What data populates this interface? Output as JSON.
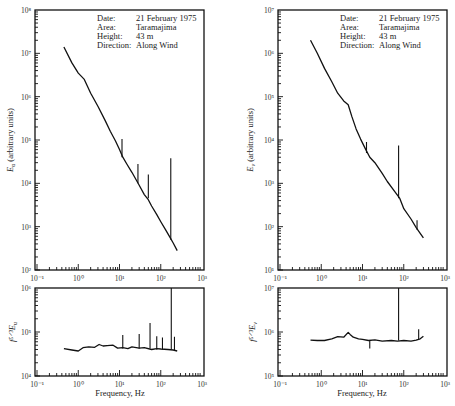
{
  "chart_data": [
    {
      "id": "left-top",
      "type": "line",
      "title": "",
      "xlabel": "",
      "ylabel": "E_u (arbitrary units)",
      "xscale": "log",
      "yscale": "log",
      "xlim": [
        0.1,
        1000
      ],
      "ylim": [
        100,
        100000000
      ],
      "x_tick_labels": [
        "10⁻¹",
        "10⁰",
        "10¹",
        "10²",
        "10³"
      ],
      "y_tick_labels": [
        "10⁸",
        "10⁷",
        "10⁶",
        "10⁵",
        "10⁴",
        "10³",
        "10²"
      ],
      "annotation": [
        {
          "key": "Date:",
          "value": "21 February 1975"
        },
        {
          "key": "Area:",
          "value": "Taramajima"
        },
        {
          "key": "Height:",
          "value": "43 m"
        },
        {
          "key": "Direction:",
          "value": "Along Wind"
        }
      ],
      "series": [
        {
          "name": "E_u",
          "x": [
            0.45,
            0.7,
            1.0,
            1.4,
            2.0,
            3.0,
            4.5,
            6.0,
            8.0,
            10,
            12,
            15,
            20,
            30,
            40,
            50,
            60,
            80,
            100,
            130,
            170,
            200,
            250
          ],
          "y": [
            14000000,
            6000000,
            3500000,
            2500000,
            1200000,
            600000,
            280000,
            160000,
            95000,
            60000,
            40000,
            28000,
            18000,
            9000,
            5500,
            4200,
            3000,
            1900,
            1300,
            850,
            550,
            420,
            280
          ],
          "spikes": [
            {
              "x": 11.5,
              "y_base": 40000,
              "y_peak": 105000
            },
            {
              "x": 28,
              "y_base": 10000,
              "y_peak": 28000
            },
            {
              "x": 50,
              "y_base": 4500,
              "y_peak": 16000
            },
            {
              "x": 175,
              "y_base": 500,
              "y_peak": 38000
            }
          ]
        }
      ]
    },
    {
      "id": "left-bottom",
      "type": "line",
      "xlabel": "Frequency, Hz",
      "ylabel": "f^{5/3}E_u",
      "xscale": "log",
      "yscale": "log",
      "xlim": [
        0.1,
        1000
      ],
      "ylim": [
        10000,
        1000000
      ],
      "x_tick_labels": [
        "10⁻¹",
        "10⁰",
        "10¹",
        "10²",
        "10³"
      ],
      "y_tick_labels": [
        "10⁶",
        "10⁵",
        "10⁴"
      ],
      "series": [
        {
          "name": "f^{5/3}E_u",
          "x": [
            0.45,
            0.7,
            1.0,
            1.3,
            1.8,
            2.5,
            3.2,
            4.0,
            5.0,
            7.0,
            9.0,
            12,
            16,
            20,
            30,
            40,
            60,
            80,
            100,
            150,
            200,
            250
          ],
          "y": [
            42000,
            39000,
            37000,
            44000,
            46000,
            45000,
            52000,
            48000,
            49000,
            50000,
            43000,
            44000,
            42000,
            46000,
            43000,
            44000,
            40000,
            42000,
            41000,
            40000,
            39000,
            37000
          ],
          "spikes": [
            {
              "x": 12,
              "y_base": 42000,
              "y_peak": 85000
            },
            {
              "x": 30,
              "y_base": 42000,
              "y_peak": 90000
            },
            {
              "x": 55,
              "y_base": 42000,
              "y_peak": 160000
            },
            {
              "x": 80,
              "y_base": 40000,
              "y_peak": 80000
            },
            {
              "x": 110,
              "y_base": 40000,
              "y_peak": 75000
            },
            {
              "x": 180,
              "y_base": 40000,
              "y_peak": 1000000
            },
            {
              "x": 215,
              "y_base": 38000,
              "y_peak": 78000
            }
          ]
        }
      ]
    },
    {
      "id": "right-top",
      "type": "line",
      "xlabel": "",
      "ylabel": "E_v (arbitrary units)",
      "xscale": "log",
      "yscale": "log",
      "xlim": [
        0.1,
        1000
      ],
      "ylim": [
        10,
        10000000
      ],
      "x_tick_labels": [
        "10⁻¹",
        "10⁰",
        "10¹",
        "10²",
        "10³"
      ],
      "y_tick_labels": [
        "10⁷",
        "10⁶",
        "10⁵",
        "10⁴",
        "10³",
        "10²",
        "10¹"
      ],
      "annotation": [
        {
          "key": "Date:",
          "value": "21 February 1975"
        },
        {
          "key": "Area:",
          "value": "Taramajima"
        },
        {
          "key": "Height:",
          "value": "43 m"
        },
        {
          "key": "Direction:",
          "value": "Along Wind"
        }
      ],
      "series": [
        {
          "name": "E_v",
          "x": [
            0.55,
            0.8,
            1.2,
            1.8,
            2.5,
            3.5,
            4.5,
            5.5,
            7.0,
            9.0,
            12,
            15,
            20,
            30,
            40,
            60,
            80,
            100,
            150,
            200,
            250,
            300
          ],
          "y": [
            2000000,
            1000000,
            450000,
            220000,
            120000,
            80000,
            65000,
            35000,
            18000,
            10500,
            6000,
            4000,
            3000,
            1700,
            1100,
            650,
            450,
            260,
            150,
            95,
            70,
            55
          ],
          "spikes": [
            {
              "x": 12.5,
              "y_base": 5000,
              "y_peak": 9000
            },
            {
              "x": 75,
              "y_base": 450,
              "y_peak": 7500
            },
            {
              "x": 210,
              "y_base": 85,
              "y_peak": 140
            }
          ]
        }
      ]
    },
    {
      "id": "right-bottom",
      "type": "line",
      "xlabel": "Frequency, Hz",
      "ylabel": "f^{5/3}E_v",
      "xscale": "log",
      "yscale": "log",
      "xlim": [
        0.1,
        1000
      ],
      "ylim": [
        100000,
        10000000
      ],
      "x_tick_labels": [
        "10⁻¹",
        "10⁰",
        "10¹",
        "10²",
        "10³"
      ],
      "y_tick_labels": [
        "10⁷",
        "10⁶",
        "10⁵"
      ],
      "series": [
        {
          "name": "f^{5/3}E_v",
          "x": [
            0.55,
            0.8,
            1.2,
            1.8,
            2.5,
            3.5,
            4.5,
            5.0,
            6.0,
            8.0,
            10,
            14,
            20,
            30,
            50,
            70,
            100,
            150,
            200,
            250,
            300
          ],
          "y": [
            650000,
            640000,
            640000,
            700000,
            780000,
            760000,
            980000,
            880000,
            760000,
            700000,
            680000,
            640000,
            660000,
            620000,
            640000,
            620000,
            640000,
            620000,
            650000,
            700000,
            800000
          ],
          "spikes": [
            {
              "x": 15,
              "y_base": 640000,
              "y_peak": 420000
            },
            {
              "x": 75,
              "y_base": 640000,
              "y_peak": 10000000
            },
            {
              "x": 230,
              "y_base": 680000,
              "y_peak": 1150000
            }
          ]
        }
      ]
    }
  ],
  "labels": {
    "left_top_ylabel_main": "E",
    "left_top_ylabel_sub": "u",
    "left_top_ylabel_rest": " (arbitrary units)",
    "left_bottom_ylabel": "f⁵ᐟ³E",
    "left_bottom_ylabel_sub": "u",
    "right_top_ylabel_main": "E",
    "right_top_ylabel_sub": "v",
    "right_top_ylabel_rest": " (arbitrary units)",
    "right_bottom_ylabel": "f⁵ᐟ³E",
    "right_bottom_ylabel_sub": "v",
    "xlabel": "Frequency, Hz"
  }
}
